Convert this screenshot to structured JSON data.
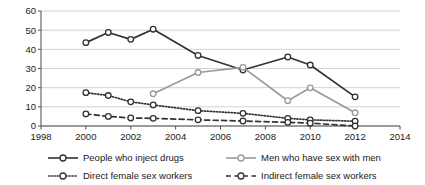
{
  "chart_data": {
    "type": "line",
    "title": "",
    "xlabel": "",
    "ylabel": "",
    "xlim": [
      1998,
      2014
    ],
    "ylim": [
      0,
      60
    ],
    "xticks": [
      1998,
      2000,
      2002,
      2004,
      2006,
      2008,
      2010,
      2012,
      2014
    ],
    "yticks": [
      0,
      10,
      20,
      30,
      40,
      50,
      60
    ],
    "grid": "horizontal",
    "legend_position": "bottom",
    "series": [
      {
        "name": "People who inject drugs",
        "color": "#333333",
        "style": "solid",
        "marker": "open-circle",
        "x": [
          2000,
          2001,
          2002,
          2003,
          2005,
          2007,
          2009,
          2010,
          2012
        ],
        "values": [
          43.5,
          48.8,
          45.2,
          50.5,
          36.8,
          29.2,
          36.0,
          31.8,
          15.2
        ]
      },
      {
        "name": "Men who have sex with men",
        "color": "#9a9a9a",
        "style": "solid",
        "marker": "open-circle",
        "x": [
          2003,
          2005,
          2007,
          2009,
          2010,
          2012
        ],
        "values": [
          16.8,
          27.9,
          30.6,
          13.2,
          19.9,
          6.9
        ]
      },
      {
        "name": "Direct female sex workers",
        "color": "#333333",
        "style": "dotted",
        "marker": "open-circle",
        "x": [
          2000,
          2001,
          2002,
          2003,
          2005,
          2007,
          2009,
          2010,
          2012
        ],
        "values": [
          17.4,
          15.9,
          12.6,
          11.0,
          8.0,
          6.6,
          4.0,
          3.2,
          2.5
        ]
      },
      {
        "name": "Indirect female sex workers",
        "color": "#333333",
        "style": "dashed",
        "marker": "open-circle",
        "x": [
          2000,
          2001,
          2002,
          2003,
          2005,
          2007,
          2009,
          2010,
          2012
        ],
        "values": [
          6.3,
          5.0,
          4.2,
          4.0,
          3.2,
          2.6,
          1.9,
          1.5,
          0.0
        ]
      }
    ]
  },
  "legend": {
    "items": [
      {
        "label": "People who inject drugs"
      },
      {
        "label": "Men who have sex with men"
      },
      {
        "label": "Direct female sex workers"
      },
      {
        "label": "Indirect female sex workers"
      }
    ]
  },
  "axes": {
    "x_tick_labels": [
      "1998",
      "2000",
      "2002",
      "2004",
      "2006",
      "2008",
      "2010",
      "2012",
      "2014"
    ],
    "y_tick_labels": [
      "0",
      "10",
      "20",
      "30",
      "40",
      "50",
      "60"
    ]
  },
  "colors": {
    "dark_series": "#333333",
    "grey_series": "#9a9a9a",
    "grid": "#c8c8c8",
    "axis": "#4d4d4d",
    "background": "#ffffff"
  }
}
